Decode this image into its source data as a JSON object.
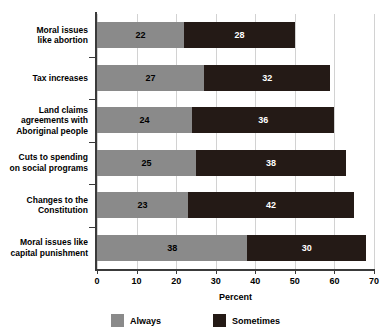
{
  "chart_data": {
    "type": "bar",
    "orientation": "horizontal",
    "stacked": true,
    "title": "",
    "xlabel": "Percent",
    "ylabel": "",
    "xlim": [
      0,
      70
    ],
    "xticks": [
      0,
      10,
      20,
      30,
      40,
      50,
      60,
      70
    ],
    "grid": true,
    "legend_position": "bottom",
    "categories": [
      "Moral issues like abortion",
      "Tax increases",
      "Land claims agreements with Aboriginal people",
      "Cuts to spending on social programs",
      "Changes to the Constitution",
      "Moral issues like capital punishment"
    ],
    "category_label_lines": [
      [
        "Moral issues",
        "like abortion"
      ],
      [
        "Tax increases"
      ],
      [
        "Land claims",
        "agreements with",
        "Aboriginal people"
      ],
      [
        "Cuts to spending",
        "on social programs"
      ],
      [
        "Changes to the",
        "Constitution"
      ],
      [
        "Moral issues like",
        "capital punishment"
      ]
    ],
    "series": [
      {
        "name": "Always",
        "color": "#8a8a8a",
        "values": [
          22,
          27,
          24,
          25,
          23,
          38
        ]
      },
      {
        "name": "Sometimes",
        "color": "#241a16",
        "values": [
          28,
          32,
          36,
          38,
          42,
          30
        ]
      }
    ],
    "totals": [
      50,
      59,
      60,
      63,
      65,
      68
    ]
  },
  "legend": {
    "items": [
      {
        "label": "Always",
        "color": "#8a8a8a"
      },
      {
        "label": "Sometimes",
        "color": "#241a16"
      }
    ]
  },
  "axis": {
    "x_title": "Percent",
    "tick_labels": [
      "0",
      "10",
      "20",
      "30",
      "40",
      "50",
      "60",
      "70"
    ]
  }
}
